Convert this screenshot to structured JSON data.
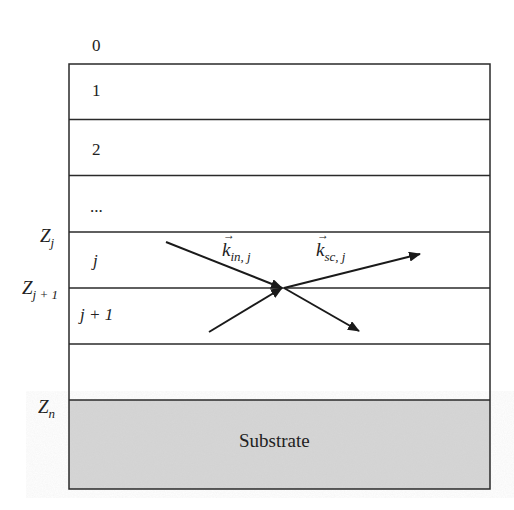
{
  "diagram": {
    "type": "multilayer-scattering-schematic",
    "layers": [
      {
        "index_label": "0",
        "region": "above-surface"
      },
      {
        "index_label": "1"
      },
      {
        "index_label": "2"
      },
      {
        "index_label": "..."
      },
      {
        "index_label": "j"
      },
      {
        "index_label": "j + 1"
      },
      {
        "index_label": ""
      }
    ],
    "layer_labels": {
      "l0": "0",
      "l1": "1",
      "l2": "2",
      "l3": "...",
      "lj": "j",
      "lj1": "j + 1"
    },
    "interfaces": {
      "zj": {
        "base": "Z",
        "sub": "j"
      },
      "zj1": {
        "base": "Z",
        "sub": "j + 1"
      },
      "zn": {
        "base": "Z",
        "sub": "n"
      }
    },
    "vectors": {
      "k_in": {
        "base": "k",
        "sub": "in, j"
      },
      "k_sc": {
        "base": "k",
        "sub": "sc, j"
      }
    },
    "substrate_label": "Substrate",
    "colors": {
      "line": "#2a2a2a",
      "substrate_fill": "#d6d6d6",
      "background": "#ffffff"
    }
  }
}
